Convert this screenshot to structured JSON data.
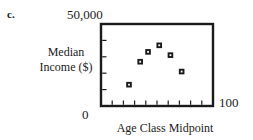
{
  "figure": {
    "part_label": "c.",
    "y_max_label": "50,000",
    "y_min_label": "0",
    "x_max_label": "100",
    "y_axis_title_line1": "Median",
    "y_axis_title_line2": "Income ($)",
    "x_axis_title": "Age Class Midpoint",
    "ink_color": "#1a1a1a",
    "background_color": "#ffffff"
  },
  "chart_data": {
    "type": "scatter",
    "title": "",
    "xlabel": "Age Class Midpoint",
    "ylabel": "Median Income ($)",
    "xlim": [
      0,
      100
    ],
    "ylim": [
      0,
      50000
    ],
    "xticklabels": [
      "0",
      "100"
    ],
    "yticklabels": [
      "0",
      "50,000"
    ],
    "x_tick_count": 9,
    "y_tick_count": 4,
    "grid": false,
    "legend": "none",
    "marker": "filled-square",
    "x": [
      25,
      35,
      42,
      52,
      62,
      72
    ],
    "y": [
      13000,
      27000,
      33000,
      37000,
      31000,
      21000
    ],
    "points": [
      {
        "x": 25,
        "y": 13000
      },
      {
        "x": 35,
        "y": 27000
      },
      {
        "x": 42,
        "y": 33000
      },
      {
        "x": 52,
        "y": 37000
      },
      {
        "x": 62,
        "y": 31000
      },
      {
        "x": 72,
        "y": 21000
      }
    ]
  }
}
